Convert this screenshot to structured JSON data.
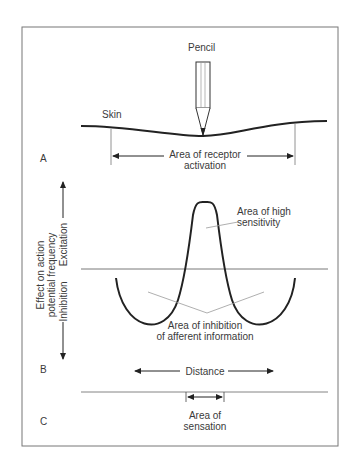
{
  "figure": {
    "panel_labels": {
      "a": "A",
      "b": "B",
      "c": "C"
    },
    "pencil_label": "Pencil",
    "skin_label": "Skin",
    "receptor_activation": {
      "line1": "Area of receptor",
      "line2": "activation"
    },
    "y_axis": {
      "title_line1": "Effect on action",
      "title_line2": "potential frequency",
      "excitation": "Excitation",
      "inhibition": "Inhibition"
    },
    "high_sensitivity": {
      "line1": "Area of high",
      "line2": "sensitivity"
    },
    "inhibition_area": {
      "line1": "Area of inhibition",
      "line2": "of afferent information"
    },
    "distance_label": "Distance",
    "sensation_area": {
      "line1": "Area of",
      "line2": "sensation"
    },
    "colors": {
      "stroke": "#222222",
      "frame": "#777777",
      "pointer": "#9a9a9a"
    }
  }
}
